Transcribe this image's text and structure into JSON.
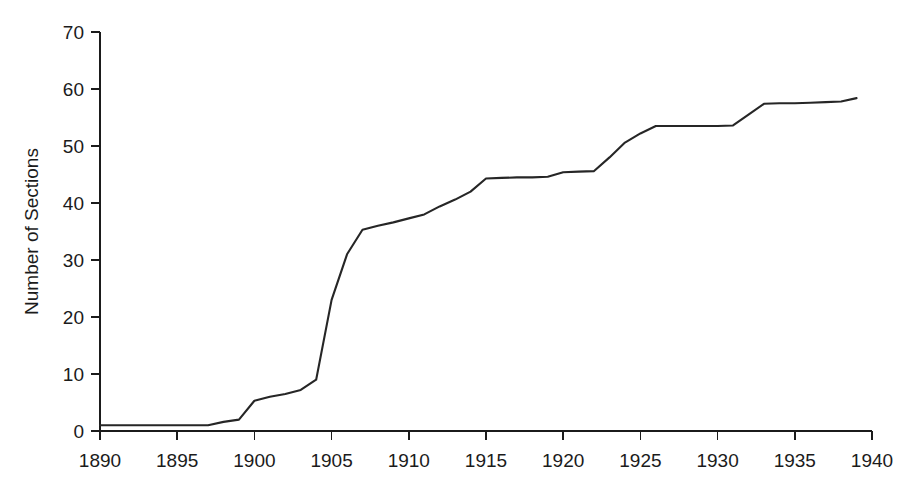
{
  "chart_data": {
    "type": "line",
    "title": "",
    "xlabel": "",
    "ylabel": "Number of Sections",
    "xlim": [
      1890,
      1940
    ],
    "ylim": [
      0,
      70
    ],
    "xticks": [
      1890,
      1895,
      1900,
      1905,
      1910,
      1915,
      1920,
      1925,
      1930,
      1935,
      1940
    ],
    "yticks": [
      0,
      10,
      20,
      30,
      40,
      50,
      60,
      70
    ],
    "xtick_labels": [
      "1890",
      "1895",
      "1900",
      "1905",
      "1910",
      "1915",
      "1920",
      "1925",
      "1930",
      "1935",
      "1940"
    ],
    "ytick_labels": [
      "0",
      "10",
      "20",
      "30",
      "40",
      "50",
      "60",
      "70"
    ],
    "grid": false,
    "legend": false,
    "legend_position": "none",
    "series": [
      {
        "name": "Number of Sections",
        "color": "#262626",
        "x": [
          1890,
          1891,
          1892,
          1893,
          1894,
          1895,
          1896,
          1897,
          1898,
          1899,
          1900,
          1901,
          1902,
          1903,
          1904,
          1905,
          1906,
          1907,
          1908,
          1909,
          1910,
          1911,
          1912,
          1913,
          1914,
          1915,
          1916,
          1917,
          1918,
          1919,
          1920,
          1921,
          1922,
          1923,
          1924,
          1925,
          1926,
          1927,
          1928,
          1929,
          1930,
          1931,
          1932,
          1933,
          1934,
          1935,
          1936,
          1937,
          1938,
          1939
        ],
        "values": [
          1,
          1,
          1,
          1,
          1,
          1,
          1,
          1,
          1.6,
          2,
          5.3,
          6,
          6.5,
          7.2,
          9,
          23,
          31,
          35.3,
          36,
          36.6,
          37.3,
          38,
          39.4,
          40.6,
          42,
          44.3,
          44.4,
          44.5,
          44.5,
          44.6,
          45.4,
          45.5,
          45.6,
          48,
          50.6,
          52.2,
          53.5,
          53.5,
          53.5,
          53.5,
          53.5,
          53.6,
          55.5,
          57.4,
          57.5,
          57.5,
          57.6,
          57.7,
          57.8,
          58.4
        ]
      }
    ],
    "annotations": []
  },
  "figure": {
    "background_color": "#ffffff",
    "axis_color": "#1b1b1b",
    "line_color": "#262626"
  }
}
